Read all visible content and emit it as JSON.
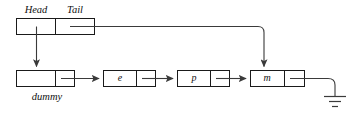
{
  "diagram": {
    "type": "linked-list-diagram",
    "colors": {
      "background": "#ffffff",
      "box_stroke": "#1a1a1a",
      "arrow_stroke": "#3a3a3a",
      "text": "#111111"
    },
    "header_struct": {
      "name": "list-header",
      "fields": [
        {
          "key": "head",
          "label": "Head"
        },
        {
          "key": "tail",
          "label": "Tail"
        }
      ]
    },
    "nodes": [
      {
        "key": "dummy",
        "value": "",
        "caption": "dummy"
      },
      {
        "key": "e",
        "value": "e",
        "caption": ""
      },
      {
        "key": "p",
        "value": "p",
        "caption": ""
      },
      {
        "key": "m",
        "value": "m",
        "caption": ""
      }
    ],
    "pointers": [
      {
        "key": "head-to-dummy",
        "from": "Head",
        "to": "dummy",
        "style": "arrow-down"
      },
      {
        "key": "dummy-to-e",
        "from": "dummy",
        "to": "e",
        "style": "arrow-right"
      },
      {
        "key": "e-to-p",
        "from": "e",
        "to": "p",
        "style": "arrow-right"
      },
      {
        "key": "p-to-m",
        "from": "p",
        "to": "m",
        "style": "arrow-right"
      },
      {
        "key": "tail-to-m",
        "from": "Tail",
        "to": "m",
        "style": "elbow-down"
      },
      {
        "key": "m-to-null",
        "from": "m",
        "to": "ground",
        "style": "ground"
      }
    ],
    "terminator": {
      "key": "null-ground",
      "symbol": "ground",
      "bars": 3
    }
  }
}
